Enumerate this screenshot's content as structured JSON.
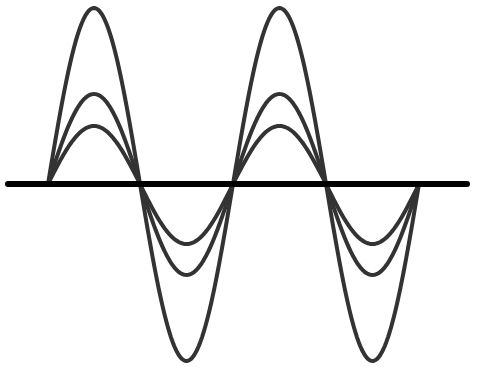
{
  "diagram": {
    "canvas": {
      "width": 477,
      "height": 370
    },
    "colors": {
      "background": "#ffffff",
      "axis": "#000000",
      "wave": "#333333"
    },
    "axis": {
      "x1": 8,
      "x2": 467,
      "y": 184,
      "stroke_width": 6
    },
    "zero_crossings_x": [
      48,
      140,
      233,
      326,
      419
    ],
    "half_cycles": 4,
    "waves": [
      {
        "name": "large-amplitude",
        "peak_y": 8,
        "trough_y": 361,
        "stroke_width": 4
      },
      {
        "name": "medium-amplitude",
        "peak_y": 94,
        "trough_y": 275,
        "stroke_width": 4
      },
      {
        "name": "small-amplitude",
        "peak_y": 126,
        "trough_y": 244,
        "stroke_width": 4
      }
    ]
  }
}
